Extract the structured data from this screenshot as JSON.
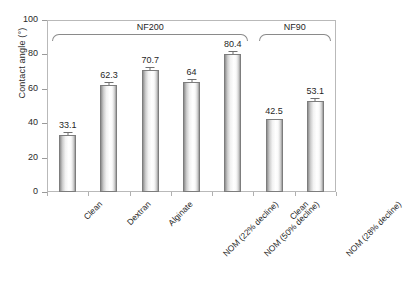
{
  "chart_data": {
    "type": "bar",
    "title": "",
    "xlabel": "",
    "ylabel": "Contact angle (°)",
    "ylim": [
      0,
      100
    ],
    "yticks": [
      0,
      20,
      40,
      60,
      80,
      100
    ],
    "ytick_labels": [
      "0",
      "20",
      "40",
      "60",
      "80",
      "100"
    ],
    "grid": false,
    "legend": "none",
    "categories": [
      "Clean",
      "Dextran",
      "Alginate",
      "NOM (22% decline)",
      "NOM (50% decline)",
      "Clean",
      "NOM (28% decline)"
    ],
    "values": [
      33.1,
      62.3,
      70.7,
      64,
      80.4,
      42.5,
      53.1
    ],
    "value_labels": [
      "33.1",
      "62.3",
      "70.7",
      "64",
      "80.4",
      "42.5",
      "53.1"
    ],
    "error_bars": [
      1.4,
      1.0,
      1.2,
      1.1,
      0.9,
      0.0,
      1.0
    ],
    "groups": [
      {
        "label": "NF200",
        "first_index": 0,
        "last_index": 4
      },
      {
        "label": "NF90",
        "first_index": 5,
        "last_index": 6
      }
    ]
  }
}
